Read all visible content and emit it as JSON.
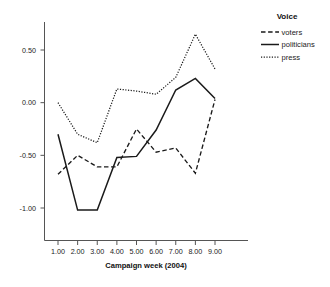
{
  "chart_data": {
    "type": "line",
    "title": "",
    "xlabel": "Campaign week (2004)",
    "ylabel": "",
    "x": [
      1,
      2,
      3,
      4,
      5,
      6,
      7,
      8,
      9
    ],
    "xtick_labels": [
      "1.00",
      "2.00",
      "3.00",
      "4.00",
      "5.00",
      "6.00",
      "7.00",
      "8.00",
      "9.00"
    ],
    "ytick_labels": [
      "0.50",
      "0.00",
      "-0.50",
      "-1.00"
    ],
    "ytick_values": [
      0.5,
      0.0,
      -0.5,
      -1.0
    ],
    "xlim": [
      0.55,
      9.6
    ],
    "ylim": [
      -1.3,
      0.78
    ],
    "grid": false,
    "legend_position": "right",
    "legend_title": "Voice",
    "series": [
      {
        "name": "voters",
        "style": "dashed",
        "color": "#1a1a1a",
        "values": [
          -0.68,
          -0.5,
          -0.61,
          -0.61,
          -0.25,
          -0.47,
          -0.43,
          -0.67,
          0.03
        ]
      },
      {
        "name": "politicians",
        "style": "solid",
        "color": "#1a1a1a",
        "values": [
          -0.3,
          -1.02,
          -1.02,
          -0.52,
          -0.51,
          -0.26,
          0.12,
          0.23,
          0.04
        ]
      },
      {
        "name": "press",
        "style": "dotted",
        "color": "#1a1a1a",
        "values": [
          0.0,
          -0.3,
          -0.38,
          0.13,
          0.11,
          0.08,
          0.24,
          0.65,
          0.32
        ]
      }
    ]
  },
  "axis": {
    "x_title": "Campaign week (2004)"
  },
  "legend": {
    "title": "Voice",
    "items": [
      {
        "label": "voters",
        "style": "dashed"
      },
      {
        "label": "politicians",
        "style": "solid"
      },
      {
        "label": "press",
        "style": "dotted"
      }
    ]
  }
}
